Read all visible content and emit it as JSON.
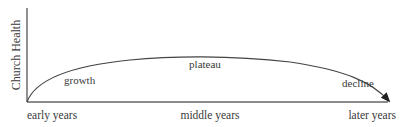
{
  "diagram": {
    "type": "life-cycle-curve",
    "y_axis_label": "Church Health",
    "x_axis_labels": [
      "early years",
      "middle years",
      "later years"
    ],
    "phases": [
      "growth",
      "plateau",
      "decline"
    ],
    "colors": {
      "axis": "#555555",
      "curve": "#444444",
      "text": "#3a3a3a"
    }
  }
}
